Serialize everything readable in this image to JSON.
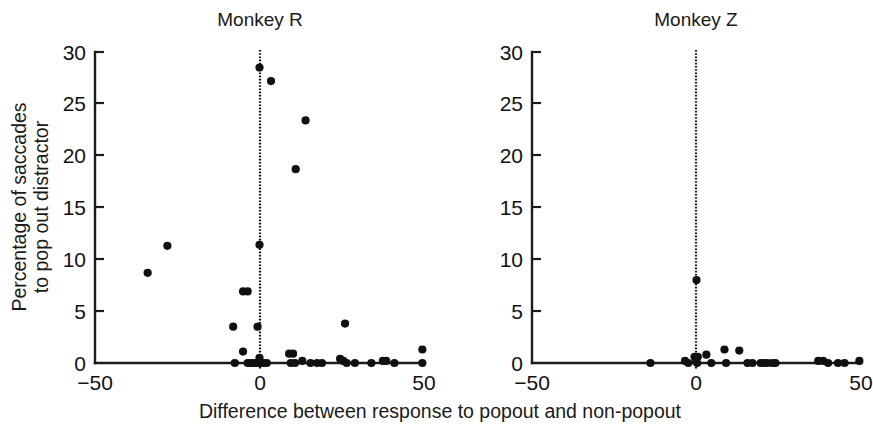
{
  "figure": {
    "xlabel": "Difference between response to popout and non-popout",
    "ylabel_line1": "Percentage of saccades",
    "ylabel_line2": "to pop out distractor",
    "point_color": "#101010",
    "axis_color": "#1c1c1c",
    "background": "#ffffff"
  },
  "chart_data": {
    "type": "scatter",
    "title": "",
    "xlabel": "Difference between response to popout and non-popout",
    "ylabel": "Percentage of saccades to pop out distractor",
    "xlim": [
      -50,
      50
    ],
    "ylim": [
      0,
      30
    ],
    "xticks": [
      -50,
      0,
      50
    ],
    "xtick_labels": [
      "−50",
      "0",
      "50"
    ],
    "yticks": [
      0,
      5,
      10,
      15,
      20,
      25,
      30
    ],
    "ytick_labels": [
      "0",
      "5",
      "10",
      "15",
      "20",
      "25",
      "30"
    ],
    "grid": false,
    "legend": "none",
    "annotations": [
      {
        "type": "vline",
        "x": 0,
        "style": "dotted",
        "panels": [
          "Monkey R",
          "Monkey Z"
        ]
      }
    ],
    "panels": [
      {
        "name": "Monkey R",
        "title": "Monkey R",
        "points": [
          {
            "x": -34.0,
            "y": 8.7
          },
          {
            "x": -28.0,
            "y": 11.3
          },
          {
            "x": -5.0,
            "y": 6.9
          },
          {
            "x": -3.6,
            "y": 6.9
          },
          {
            "x": -8.0,
            "y": 3.5
          },
          {
            "x": -0.6,
            "y": 3.5
          },
          {
            "x": -5.0,
            "y": 1.1
          },
          {
            "x": 0.0,
            "y": 28.5
          },
          {
            "x": 3.5,
            "y": 27.2
          },
          {
            "x": 14.0,
            "y": 23.4
          },
          {
            "x": 11.0,
            "y": 18.7
          },
          {
            "x": 0.0,
            "y": 11.4
          },
          {
            "x": 26.0,
            "y": 3.8
          },
          {
            "x": 0.0,
            "y": 0.5
          },
          {
            "x": -7.5,
            "y": 0.0
          },
          {
            "x": -3.6,
            "y": 0.0
          },
          {
            "x": -2.8,
            "y": 0.0
          },
          {
            "x": -1.8,
            "y": 0.0
          },
          {
            "x": -1.0,
            "y": 0.0
          },
          {
            "x": 0.0,
            "y": 0.0
          },
          {
            "x": 1.2,
            "y": 0.0
          },
          {
            "x": 2.2,
            "y": 0.0
          },
          {
            "x": 9.0,
            "y": 0.9
          },
          {
            "x": 10.2,
            "y": 0.9
          },
          {
            "x": 9.5,
            "y": 0.0
          },
          {
            "x": 10.8,
            "y": 0.0
          },
          {
            "x": 13.0,
            "y": 0.2
          },
          {
            "x": 15.5,
            "y": 0.0
          },
          {
            "x": 17.5,
            "y": 0.0
          },
          {
            "x": 19.0,
            "y": 0.0
          },
          {
            "x": 24.5,
            "y": 0.4
          },
          {
            "x": 25.5,
            "y": 0.2
          },
          {
            "x": 26.5,
            "y": 0.0
          },
          {
            "x": 29.0,
            "y": 0.0
          },
          {
            "x": 34.0,
            "y": 0.0
          },
          {
            "x": 37.5,
            "y": 0.2
          },
          {
            "x": 38.5,
            "y": 0.2
          },
          {
            "x": 41.0,
            "y": 0.0
          },
          {
            "x": 49.5,
            "y": 1.3
          },
          {
            "x": 49.5,
            "y": 0.0
          }
        ]
      },
      {
        "name": "Monkey Z",
        "title": "Monkey Z",
        "points": [
          {
            "x": 0.0,
            "y": 8.0
          },
          {
            "x": -14.0,
            "y": 0.0
          },
          {
            "x": -3.5,
            "y": 0.2
          },
          {
            "x": -2.5,
            "y": 0.0
          },
          {
            "x": -0.6,
            "y": 0.6
          },
          {
            "x": -0.2,
            "y": 0.2
          },
          {
            "x": 0.4,
            "y": 0.6
          },
          {
            "x": 0.2,
            "y": 0.0
          },
          {
            "x": 3.0,
            "y": 0.8
          },
          {
            "x": 4.5,
            "y": 0.0
          },
          {
            "x": 8.5,
            "y": 1.3
          },
          {
            "x": 9.0,
            "y": 0.0
          },
          {
            "x": 13.0,
            "y": 1.2
          },
          {
            "x": 15.5,
            "y": 0.0
          },
          {
            "x": 17.0,
            "y": 0.0
          },
          {
            "x": 19.5,
            "y": 0.0
          },
          {
            "x": 20.5,
            "y": 0.0
          },
          {
            "x": 21.5,
            "y": 0.0
          },
          {
            "x": 23.0,
            "y": 0.0
          },
          {
            "x": 24.0,
            "y": 0.0
          },
          {
            "x": 37.0,
            "y": 0.2
          },
          {
            "x": 38.5,
            "y": 0.2
          },
          {
            "x": 40.0,
            "y": 0.0
          },
          {
            "x": 43.0,
            "y": 0.0
          },
          {
            "x": 45.0,
            "y": 0.0
          },
          {
            "x": 49.5,
            "y": 0.2
          }
        ]
      }
    ]
  }
}
